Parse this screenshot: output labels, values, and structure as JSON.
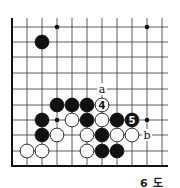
{
  "diagram": {
    "caption": "6 도",
    "grid": {
      "origin_x": 12,
      "origin_y": 27,
      "spacing": 15,
      "cols": 11,
      "rows": 10,
      "row_y": [
        27,
        42,
        57,
        73,
        89,
        105,
        120,
        135,
        151,
        166
      ],
      "col_x": [
        12,
        27,
        42,
        57,
        72,
        87,
        102,
        117,
        132,
        147,
        162
      ],
      "right_extent": 168,
      "top_extent": 18
    },
    "colors": {
      "line": "#333333",
      "black_stone": "#111111",
      "white_stone": "#ffffff",
      "edge": "#111111"
    },
    "star_points": [
      {
        "col": 3,
        "row": 0
      },
      {
        "col": 9,
        "row": 0
      },
      {
        "col": 3,
        "row": 6
      },
      {
        "col": 9,
        "row": 6
      }
    ],
    "stones": [
      {
        "color": "black",
        "col": 2,
        "row": 1
      },
      {
        "color": "black",
        "col": 3,
        "row": 5
      },
      {
        "color": "black",
        "col": 4,
        "row": 5
      },
      {
        "color": "black",
        "col": 5,
        "row": 5
      },
      {
        "color": "white",
        "col": 6,
        "row": 5,
        "label": "4"
      },
      {
        "color": "black",
        "col": 2,
        "row": 6
      },
      {
        "color": "white",
        "col": 4,
        "row": 6
      },
      {
        "color": "black",
        "col": 5,
        "row": 6
      },
      {
        "color": "white",
        "col": 6,
        "row": 6
      },
      {
        "color": "black",
        "col": 7,
        "row": 6
      },
      {
        "color": "black",
        "col": 8,
        "row": 6,
        "label": "5"
      },
      {
        "color": "black",
        "col": 2,
        "row": 7
      },
      {
        "color": "white",
        "col": 3,
        "row": 7
      },
      {
        "color": "white",
        "col": 5,
        "row": 7
      },
      {
        "color": "black",
        "col": 6,
        "row": 7
      },
      {
        "color": "white",
        "col": 7,
        "row": 7
      },
      {
        "color": "white",
        "col": 8,
        "row": 7
      },
      {
        "color": "white",
        "col": 1,
        "row": 8
      },
      {
        "color": "white",
        "col": 2,
        "row": 8
      },
      {
        "color": "white",
        "col": 5,
        "row": 8
      },
      {
        "color": "black",
        "col": 6,
        "row": 8
      },
      {
        "color": "black",
        "col": 7,
        "row": 8
      }
    ],
    "point_labels": [
      {
        "text": "a",
        "col": 6,
        "row": 4
      },
      {
        "text": "b",
        "col": 9,
        "row": 7
      }
    ]
  }
}
